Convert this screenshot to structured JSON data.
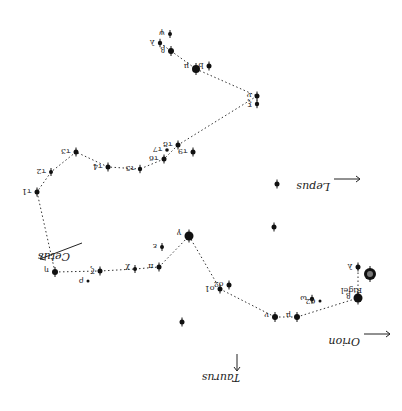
{
  "chart_data": {
    "type": "star-chart",
    "rotation_deg": 180,
    "stars": [
      {
        "id": "lambda",
        "label": "λ",
        "x": 160,
        "y": 43,
        "r": 2.2
      },
      {
        "id": "psi",
        "label": "ψ",
        "x": 170,
        "y": 34,
        "r": 2
      },
      {
        "id": "beta",
        "label": "β",
        "x": 171,
        "y": 51,
        "r": 3
      },
      {
        "id": "mu",
        "label": "μ",
        "x": 196,
        "y": 69,
        "r": 4
      },
      {
        "id": "b",
        "label": "b",
        "x": 209,
        "y": 66,
        "r": 2.5
      },
      {
        "id": "nu",
        "label": "ν",
        "x": 257,
        "y": 96,
        "r": 2.5
      },
      {
        "id": "xi",
        "label": "ξ",
        "x": 257,
        "y": 104,
        "r": 2.2
      },
      {
        "id": "tau9",
        "label": "τ9",
        "x": 193,
        "y": 152,
        "r": 2.5
      },
      {
        "id": "tau8",
        "label": "τ8",
        "x": 178,
        "y": 145,
        "r": 2.5
      },
      {
        "id": "tau7",
        "label": "τ7",
        "x": 167,
        "y": 150,
        "r": 1.8
      },
      {
        "id": "tau6",
        "label": "τ6",
        "x": 164,
        "y": 159,
        "r": 2.5
      },
      {
        "id": "tau5",
        "label": "τ5",
        "x": 140,
        "y": 169,
        "r": 2.2
      },
      {
        "id": "tau4",
        "label": "τ4",
        "x": 108,
        "y": 167,
        "r": 2.5
      },
      {
        "id": "tau3",
        "label": "τ3",
        "x": 76,
        "y": 152,
        "r": 2.5
      },
      {
        "id": "tau2",
        "label": "τ2",
        "x": 51,
        "y": 172,
        "r": 2
      },
      {
        "id": "tau1",
        "label": "τ1",
        "x": 37,
        "y": 192,
        "r": 2.5
      },
      {
        "id": "eta",
        "label": "η",
        "x": 55,
        "y": 272,
        "r": 3
      },
      {
        "id": "zeta",
        "label": "ζ",
        "x": 100,
        "y": 271,
        "r": 2.5
      },
      {
        "id": "chi",
        "label": "χ",
        "x": 135,
        "y": 269,
        "r": 2
      },
      {
        "id": "pi",
        "label": "π",
        "x": 159,
        "y": 267,
        "r": 2.5
      },
      {
        "id": "epsilon",
        "label": "ε",
        "x": 162,
        "y": 247,
        "r": 2
      },
      {
        "id": "gamma",
        "label": "γ",
        "x": 189,
        "y": 236,
        "r": 4.5
      },
      {
        "id": "o1",
        "label": "ο1",
        "x": 220,
        "y": 289,
        "r": 2.5
      },
      {
        "id": "o2",
        "label": "ο2",
        "x": 229,
        "y": 285,
        "r": 2.5
      },
      {
        "id": "nu2",
        "label": "ν",
        "x": 275,
        "y": 317,
        "r": 3
      },
      {
        "id": "mu2",
        "label": "μ",
        "x": 297,
        "y": 317,
        "r": 3
      },
      {
        "id": "omega",
        "label": "ω",
        "x": 312,
        "y": 299,
        "r": 2.2
      },
      {
        "id": "s62",
        "label": "62",
        "x": 320,
        "y": 301,
        "r": 1.5
      },
      {
        "id": "beta2",
        "label": "β",
        "x": 358,
        "y": 298,
        "r": 4.5
      },
      {
        "id": "lambda2",
        "label": "λ",
        "x": 358,
        "y": 267,
        "r": 2.5
      },
      {
        "id": "rigel",
        "label": "Rigel",
        "x": 370,
        "y": 274,
        "r": 6
      },
      {
        "id": "lone1",
        "label": "",
        "x": 277,
        "y": 184,
        "r": 2.5
      },
      {
        "id": "lone2",
        "label": "",
        "x": 274,
        "y": 227,
        "r": 2.5
      },
      {
        "id": "lone3",
        "label": "",
        "x": 182,
        "y": 322,
        "r": 2.5
      },
      {
        "id": "rho",
        "label": "ρ",
        "x": 88,
        "y": 281,
        "r": 1.5
      }
    ],
    "path": [
      "lambda",
      "beta",
      "mu",
      "nu",
      "tau8",
      "tau6",
      "tau5",
      "tau4",
      "tau3",
      "tau2",
      "tau1",
      "eta",
      "zeta",
      "chi",
      "pi",
      "gamma",
      "o1",
      "nu2",
      "mu2",
      "beta2",
      "lambda2"
    ],
    "constellations": [
      {
        "name": "Lepus",
        "x": 330,
        "y": 183,
        "arrow": "right"
      },
      {
        "name": "Cetus",
        "x": 70,
        "y": 253,
        "arrow": "left-down"
      },
      {
        "name": "Orion",
        "x": 360,
        "y": 338,
        "arrow": "right"
      },
      {
        "name": "Taurus",
        "x": 240,
        "y": 374,
        "arrow": "down"
      }
    ]
  }
}
